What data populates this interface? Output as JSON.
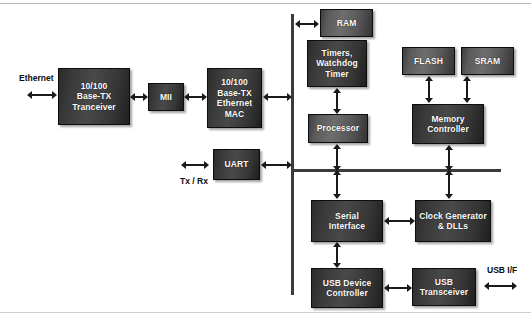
{
  "diagram": {
    "colors": {
      "block_dark": "#3a3a3a",
      "block_light": "#5b5b5b",
      "bus": "#3b3b3b",
      "arrow": "#1a1a1a",
      "text_on_block": "#ffffff",
      "text_label": "#0b0b0b",
      "background": "#ffffff"
    },
    "blocks": [
      {
        "id": "transceiver",
        "label": "10/100\nBase-TX\nTranceiver"
      },
      {
        "id": "mii",
        "label": "MII"
      },
      {
        "id": "mac",
        "label": "10/100\nBase-TX\nEthernet\nMAC"
      },
      {
        "id": "uart",
        "label": "UART"
      },
      {
        "id": "ram",
        "label": "RAM"
      },
      {
        "id": "timers",
        "label": "Timers,\nWatchdog\nTimer"
      },
      {
        "id": "processor",
        "label": "Processor"
      },
      {
        "id": "flash",
        "label": "FLASH"
      },
      {
        "id": "sram",
        "label": "SRAM"
      },
      {
        "id": "memory_ctrl",
        "label": "Memory\nController"
      },
      {
        "id": "serial_if",
        "label": "Serial\nInterface"
      },
      {
        "id": "clock_gen",
        "label": "Clock Generator\n& DLLs"
      },
      {
        "id": "usb_device",
        "label": "USB Device\nController"
      },
      {
        "id": "usb_transceiver",
        "label": "USB\nTransceiver"
      }
    ],
    "labels": [
      {
        "id": "ethernet",
        "text": "Ethernet"
      },
      {
        "id": "txrx",
        "text": "Tx / Rx"
      },
      {
        "id": "usb_if",
        "text": "USB I/F"
      }
    ],
    "block_text": {
      "transceiver_l1": "10/100",
      "transceiver_l2": "Base-TX",
      "transceiver_l3": "Tranceiver",
      "mii": "MII",
      "mac_l1": "10/100",
      "mac_l2": "Base-TX",
      "mac_l3": "Ethernet",
      "mac_l4": "MAC",
      "uart": "UART",
      "ram": "RAM",
      "timers_l1": "Timers,",
      "timers_l2": "Watchdog",
      "timers_l3": "Timer",
      "processor": "Processor",
      "flash": "FLASH",
      "sram": "SRAM",
      "memory_ctrl_l1": "Memory",
      "memory_ctrl_l2": "Controller",
      "serial_if_l1": "Serial",
      "serial_if_l2": "Interface",
      "clock_gen_l1": "Clock Generator",
      "clock_gen_l2": "& DLLs",
      "usb_device_l1": "USB Device",
      "usb_device_l2": "Controller",
      "usb_transceiver_l1": "USB",
      "usb_transceiver_l2": "Transceiver"
    },
    "external_labels": {
      "ethernet": "Ethernet",
      "txrx": "Tx / Rx",
      "usb_if": "USB I/F"
    }
  }
}
